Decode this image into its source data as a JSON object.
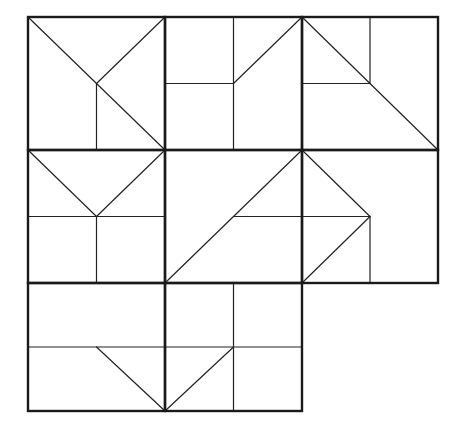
{
  "diagram": {
    "type": "tangram-style grid puzzle",
    "width": 461,
    "height": 426,
    "background": "#ffffff",
    "line_color": "#1a1a1a",
    "grid": {
      "columns_x": [
        28,
        165,
        302,
        438
      ],
      "rows_y": [
        17,
        150,
        283,
        411
      ]
    },
    "cells": [
      {
        "id": "r1c1",
        "box": [
          28,
          17,
          165,
          150
        ],
        "segments": [
          [
            28,
            17,
            165,
            150
          ],
          [
            96.5,
            83.5,
            165,
            17
          ],
          [
            96.5,
            83.5,
            96.5,
            150
          ]
        ]
      },
      {
        "id": "r1c2",
        "box": [
          165,
          17,
          302,
          150
        ],
        "segments": [
          [
            233.5,
            17,
            233.5,
            150
          ],
          [
            165,
            83.5,
            233.5,
            83.5
          ],
          [
            233.5,
            83.5,
            302,
            17
          ]
        ]
      },
      {
        "id": "r1c3",
        "box": [
          302,
          17,
          438,
          150
        ],
        "segments": [
          [
            302,
            17,
            438,
            150
          ],
          [
            370,
            17,
            370,
            83.5
          ],
          [
            302,
            83.5,
            370,
            83.5
          ]
        ]
      },
      {
        "id": "r2c1",
        "box": [
          28,
          150,
          165,
          283
        ],
        "segments": [
          [
            28,
            150,
            96.5,
            216.5
          ],
          [
            165,
            150,
            96.5,
            216.5
          ],
          [
            28,
            216.5,
            165,
            216.5
          ],
          [
            96.5,
            216.5,
            96.5,
            283
          ]
        ]
      },
      {
        "id": "r2c2",
        "box": [
          165,
          150,
          302,
          283
        ],
        "segments": [
          [
            165,
            283,
            302,
            150
          ],
          [
            233.5,
            216.5,
            302,
            216.5
          ]
        ]
      },
      {
        "id": "r2c3",
        "box": [
          302,
          150,
          438,
          283
        ],
        "segments": [
          [
            302,
            150,
            370,
            216.5
          ],
          [
            370,
            216.5,
            302,
            283
          ],
          [
            302,
            216.5,
            370,
            216.5
          ],
          [
            370,
            216.5,
            370,
            283
          ]
        ]
      },
      {
        "id": "r3c1",
        "box": [
          28,
          283,
          165,
          411
        ],
        "segments": [
          [
            28,
            347,
            165,
            347
          ],
          [
            96.5,
            347,
            165,
            411
          ]
        ]
      },
      {
        "id": "r3c2",
        "box": [
          165,
          283,
          302,
          411
        ],
        "segments": [
          [
            233.5,
            283,
            233.5,
            411
          ],
          [
            165,
            347,
            302,
            347
          ],
          [
            165,
            411,
            233.5,
            347
          ]
        ]
      }
    ]
  }
}
